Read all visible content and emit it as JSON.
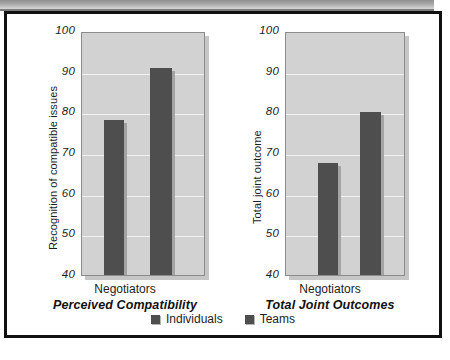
{
  "figure": {
    "legend": {
      "position": "bottom-center",
      "entries": [
        {
          "label": "Individuals",
          "color": "#4e4e4e"
        },
        {
          "label": "Teams",
          "color": "#4e4e4e"
        }
      ]
    },
    "panels": [
      {
        "id": "perceived-compatibility",
        "title": "Perceived Compatibility",
        "ylabel": "Recognition of compatible issues",
        "xlabel": "Negotiators"
      },
      {
        "id": "total-joint-outcomes",
        "title": "Total Joint Outcomes",
        "ylabel": "Total joint outcome",
        "xlabel": "Negotiators"
      }
    ]
  },
  "chart_data": [
    {
      "type": "bar",
      "title": "Perceived Compatibility",
      "xlabel": "Negotiators",
      "ylabel": "Recognition of compatible issues",
      "categories": [
        "Negotiators"
      ],
      "series": [
        {
          "name": "Individuals",
          "values": [
            78
          ],
          "color": "#4e4e4e"
        },
        {
          "name": "Teams",
          "values": [
            90.8
          ],
          "color": "#4e4e4e"
        }
      ],
      "ylim": [
        40,
        100
      ],
      "yticks": [
        40,
        50,
        60,
        70,
        80,
        90,
        100
      ],
      "ytick_labels": [
        "40",
        "50",
        "60",
        "70",
        "80",
        "90",
        "100"
      ],
      "grid": true,
      "legend": "bottom",
      "plot_background": "#d2d2d2"
    },
    {
      "type": "bar",
      "title": "Total Joint Outcomes",
      "xlabel": "Negotiators",
      "ylabel": "Total joint outcome",
      "categories": [
        "Negotiators"
      ],
      "series": [
        {
          "name": "Individuals",
          "values": [
            67.5
          ],
          "color": "#4e4e4e"
        },
        {
          "name": "Teams",
          "values": [
            80
          ],
          "color": "#4e4e4e"
        }
      ],
      "ylim": [
        40,
        100
      ],
      "yticks": [
        40,
        50,
        60,
        70,
        80,
        90,
        100
      ],
      "ytick_labels": [
        "40",
        "50",
        "60",
        "70",
        "80",
        "90",
        "100"
      ],
      "grid": true,
      "legend": "bottom",
      "plot_background": "#d2d2d2"
    }
  ]
}
